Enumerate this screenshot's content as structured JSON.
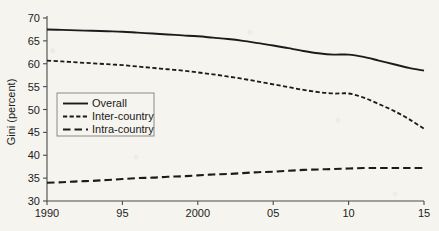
{
  "chart_data": {
    "type": "line",
    "title": "",
    "xlabel": "",
    "ylabel": "Gini (percent)",
    "xlim": [
      1990,
      2015
    ],
    "ylim": [
      30,
      70
    ],
    "grid": false,
    "legend_position": "center-left-inside",
    "x_tick_labels": [
      "1990",
      "95",
      "2000",
      "05",
      "10",
      "15"
    ],
    "x_tick_values": [
      1990,
      1995,
      2000,
      2005,
      2010,
      2015
    ],
    "y_tick_labels": [
      "30",
      "35",
      "40",
      "45",
      "50",
      "55",
      "60",
      "65",
      "70"
    ],
    "y_tick_values": [
      30,
      35,
      40,
      45,
      50,
      55,
      60,
      65,
      70
    ],
    "x": [
      1990,
      1991,
      1992,
      1993,
      1994,
      1995,
      1996,
      1997,
      1998,
      1999,
      2000,
      2001,
      2002,
      2003,
      2004,
      2005,
      2006,
      2007,
      2008,
      2009,
      2010,
      2011,
      2012,
      2013,
      2014,
      2015
    ],
    "series": [
      {
        "name": "Overall",
        "style": "solid",
        "values": [
          67.5,
          67.4,
          67.3,
          67.2,
          67.1,
          67.0,
          66.8,
          66.6,
          66.4,
          66.2,
          66.0,
          65.7,
          65.4,
          65.0,
          64.5,
          64.0,
          63.4,
          62.8,
          62.3,
          62.0,
          62.0,
          61.5,
          60.7,
          59.9,
          59.1,
          58.5
        ]
      },
      {
        "name": "Inter-country",
        "style": "dotted-dash",
        "values": [
          60.7,
          60.5,
          60.3,
          60.1,
          59.9,
          59.7,
          59.4,
          59.1,
          58.8,
          58.5,
          58.1,
          57.7,
          57.2,
          56.7,
          56.1,
          55.5,
          54.9,
          54.3,
          53.8,
          53.5,
          53.5,
          52.6,
          51.2,
          49.7,
          47.9,
          45.8
        ]
      },
      {
        "name": "Intra-country",
        "style": "long-dash",
        "values": [
          34.0,
          34.1,
          34.3,
          34.4,
          34.6,
          34.8,
          35.0,
          35.1,
          35.3,
          35.4,
          35.6,
          35.8,
          35.9,
          36.1,
          36.3,
          36.4,
          36.6,
          36.8,
          36.9,
          37.0,
          37.1,
          37.2,
          37.2,
          37.2,
          37.2,
          37.2
        ]
      }
    ]
  },
  "legend": {
    "items": [
      {
        "label": "Overall"
      },
      {
        "label": "Inter-country"
      },
      {
        "label": "Intra-country"
      }
    ]
  },
  "colors": {
    "ink": "#1b1b1b",
    "axis": "#4a4a46",
    "paper": "#f6f4ef",
    "legend_border": "#8d8a82"
  }
}
